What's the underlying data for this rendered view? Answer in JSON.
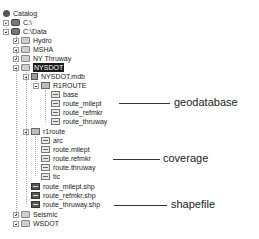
{
  "tree": {
    "items": [
      {
        "label": "Catalog",
        "icon": "catalog-icon",
        "x": 3,
        "y": 9,
        "expander": null
      },
      {
        "label": "C:\\",
        "icon": "drive-icon",
        "x": 3,
        "y": 18,
        "expander": "plus"
      },
      {
        "label": "C:\\Data",
        "icon": "drive-icon",
        "x": 3,
        "y": 27,
        "expander": "minus"
      },
      {
        "label": "Hydro",
        "icon": "folder-icon",
        "x": 13,
        "y": 36,
        "expander": "plus"
      },
      {
        "label": "MSHA",
        "icon": "folder-icon",
        "x": 13,
        "y": 45,
        "expander": "plus"
      },
      {
        "label": "NY Thruway",
        "icon": "folder-icon",
        "x": 13,
        "y": 54,
        "expander": "plus"
      },
      {
        "label": "NYSDOT",
        "icon": "folder-icon",
        "x": 13,
        "y": 63,
        "expander": "minus",
        "selected": true
      },
      {
        "label": "NYSDOT.mdb",
        "icon": "personal-geodatabase-icon",
        "x": 23,
        "y": 72,
        "expander": "minus"
      },
      {
        "label": "R1ROUTE",
        "icon": "feature-dataset-icon",
        "x": 33,
        "y": 81,
        "expander": "minus"
      },
      {
        "label": "base",
        "icon": "feature-class-icon",
        "x": 51,
        "y": 90,
        "expander": null
      },
      {
        "label": "route_milept",
        "icon": "feature-class-icon",
        "x": 51,
        "y": 99,
        "expander": null
      },
      {
        "label": "route_refmkr",
        "icon": "feature-class-icon",
        "x": 51,
        "y": 108,
        "expander": null
      },
      {
        "label": "route_thruway",
        "icon": "feature-class-icon",
        "x": 51,
        "y": 117,
        "expander": null
      },
      {
        "label": "r1route",
        "icon": "coverage-icon",
        "x": 23,
        "y": 127,
        "expander": "minus"
      },
      {
        "label": "arc",
        "icon": "coverage-feature-class-icon",
        "x": 41,
        "y": 136,
        "expander": null
      },
      {
        "label": "route.milept",
        "icon": "coverage-feature-class-icon",
        "x": 41,
        "y": 145,
        "expander": null
      },
      {
        "label": "route.refmkr",
        "icon": "coverage-feature-class-icon",
        "x": 41,
        "y": 154,
        "expander": null
      },
      {
        "label": "route.thruway",
        "icon": "coverage-feature-class-icon",
        "x": 41,
        "y": 163,
        "expander": null
      },
      {
        "label": "tic",
        "icon": "coverage-feature-class-icon",
        "x": 41,
        "y": 172,
        "expander": null
      },
      {
        "label": "route_milept.shp",
        "icon": "shapefile-icon",
        "x": 31,
        "y": 182,
        "expander": null
      },
      {
        "label": "route_refmkr.shp",
        "icon": "shapefile-icon",
        "x": 31,
        "y": 191,
        "expander": null
      },
      {
        "label": "route_thruway.shp",
        "icon": "shapefile-icon",
        "x": 31,
        "y": 200,
        "expander": null
      },
      {
        "label": "Seismic",
        "icon": "folder-icon",
        "x": 13,
        "y": 210,
        "expander": "plus"
      },
      {
        "label": "WSDOT",
        "icon": "folder-icon",
        "x": 13,
        "y": 219,
        "expander": "plus"
      }
    ]
  },
  "annotations": [
    {
      "label": "geodatabase",
      "line_x1": 119,
      "line_x2": 170,
      "y": 103,
      "text_x": 174,
      "text_y": 96
    },
    {
      "label": "coverage",
      "line_x1": 113,
      "line_x2": 160,
      "y": 159,
      "text_x": 163,
      "text_y": 152
    },
    {
      "label": "shapefile",
      "line_x1": 114,
      "line_x2": 167,
      "y": 205,
      "text_x": 171,
      "text_y": 198
    }
  ]
}
